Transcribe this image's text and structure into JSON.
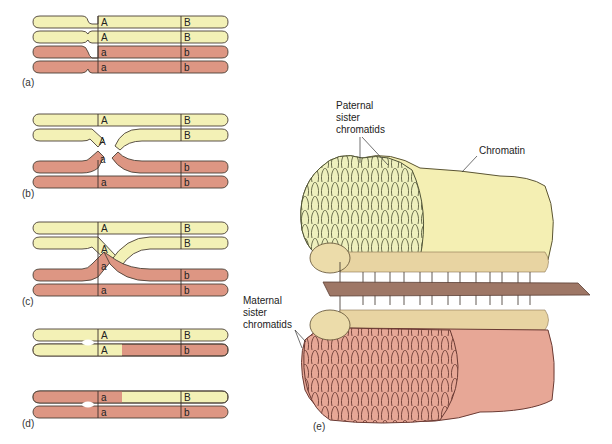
{
  "figure": {
    "colors": {
      "paternal": "#f3f1b6",
      "maternal": "#dd9683",
      "outline": "#4a3f35",
      "centromere": "#e8d9a6",
      "plate": "#9e7766",
      "chromatin_pale": "#f4efb3"
    },
    "panels": [
      {
        "id": "a",
        "label": "(a)"
      },
      {
        "id": "b",
        "label": "(b)"
      },
      {
        "id": "c",
        "label": "(c)"
      },
      {
        "id": "d",
        "label": "(d)"
      },
      {
        "id": "e",
        "label": "(e)"
      }
    ],
    "genes": {
      "paternal_A": "A",
      "paternal_B": "B",
      "maternal_a": "a",
      "maternal_b": "b"
    },
    "panel_e_labels": {
      "paternal_line1": "Paternal",
      "paternal_line2": "sister",
      "paternal_line3": "chromatids",
      "chromatin": "Chromatin",
      "maternal_line1": "Maternal",
      "maternal_line2": "sister",
      "maternal_line3": "chromatids"
    }
  }
}
